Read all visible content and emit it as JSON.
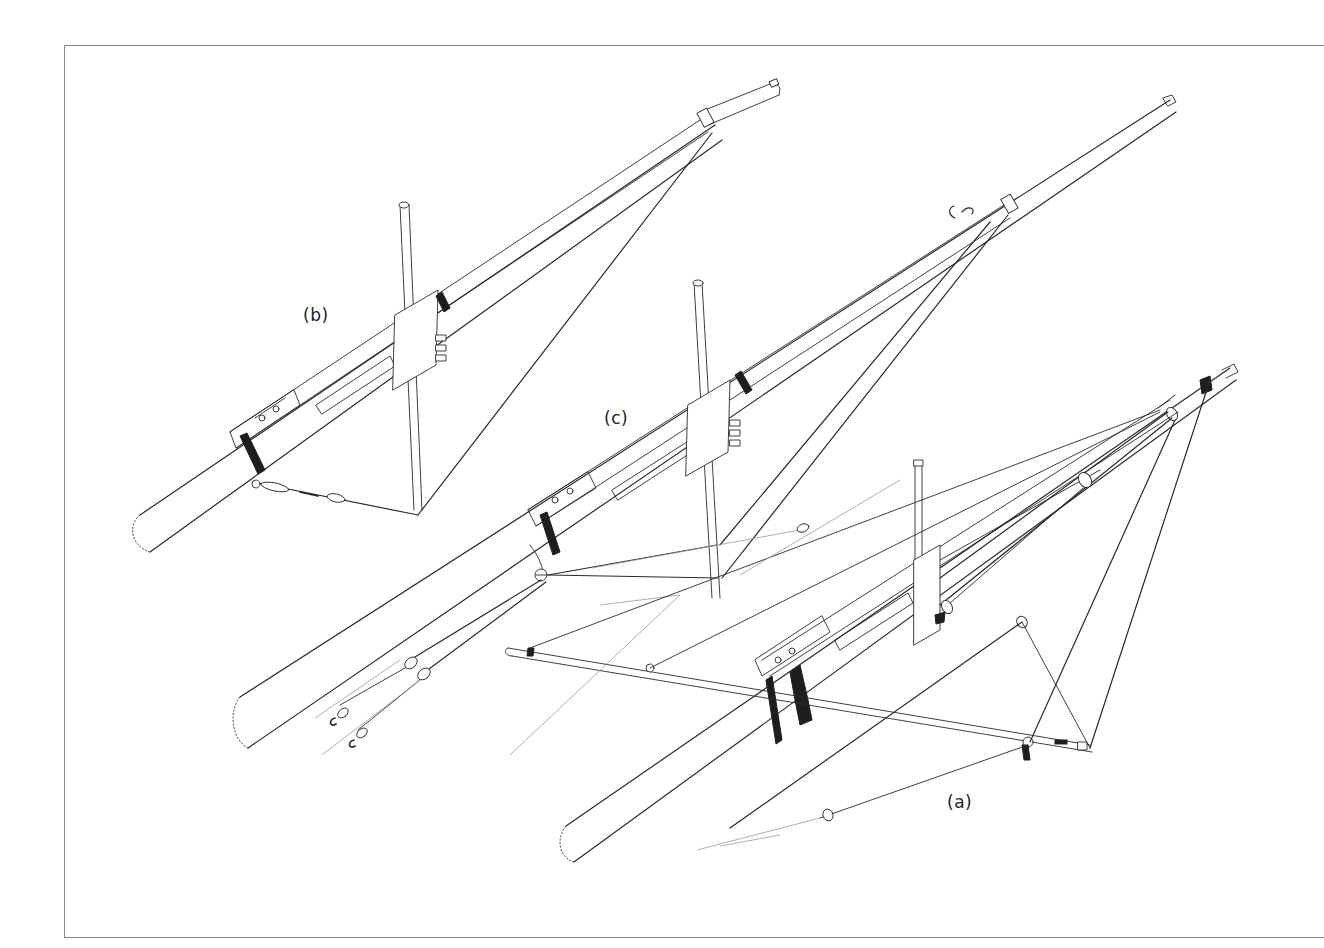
{
  "figure": {
    "type": "technical-line-drawing",
    "labels": [
      {
        "id": "a",
        "text": "(a)",
        "x": 947,
        "y": 792
      },
      {
        "id": "b",
        "text": "(b)",
        "x": 303,
        "y": 305
      },
      {
        "id": "c",
        "text": "(c)",
        "x": 604,
        "y": 408
      }
    ],
    "colors": {
      "background": "#ffffff",
      "ink": "#2a2a2a",
      "frame": "#8a8a8a",
      "faint": "#9a9a9a"
    }
  }
}
